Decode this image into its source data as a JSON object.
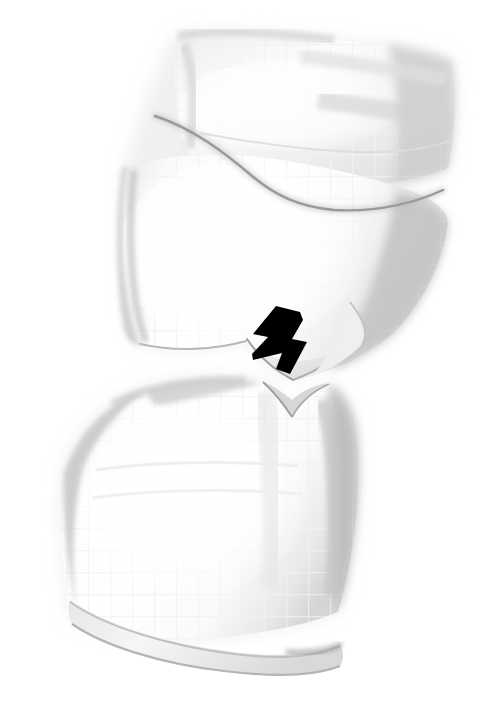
{
  "figure": {
    "title": "Vertebral body compression deformity",
    "modality": "grayscale anatomical line-and-wash illustration",
    "background_color": "#ffffff",
    "canvas": {
      "width": 491,
      "height": 726
    },
    "caption": "",
    "labels": []
  },
  "palette": {
    "background": "#ffffff",
    "bone_fill_light": "#fdfdfd",
    "bone_fill_mid": "#f4f4f4",
    "bone_fill_shadow": "#e3e3e3",
    "bone_edge_soft": "#cfcfcf",
    "bone_edge_dark": "#9a9a9a",
    "contour_line": "#7d7d7d",
    "deep_shadow": "#8e8e8e",
    "marker_black": "#000000",
    "texture_grid": "#f2f2f2"
  },
  "structures": [
    {
      "id": "upper-vertebral-body",
      "name": "Upper vertebral body",
      "bbox": {
        "x": 115,
        "y": 30,
        "width": 340,
        "height": 355
      },
      "description": "Superior vertebra shown in oblique view with a dark curved contour line separating the superior endplate region from the body, and a wedge-shaped inferior-anterior defect.",
      "fill": "#fbfbfb",
      "shadow_side": "right"
    },
    {
      "id": "upper-endplate-ridge",
      "name": "Superior endplate ridge of upper vertebra",
      "description": "Curved dark contour sweeping from upper left down to the right margin.",
      "stroke": "#7d7d7d"
    },
    {
      "id": "inferior-notch-defect",
      "name": "Inferior wedge notch of upper vertebra",
      "bbox": {
        "x": 240,
        "y": 300,
        "width": 120,
        "height": 100
      },
      "description": "V-shaped notch / step-off at the inferior margin of the upper vertebral body, the site indicated by the arrow."
    },
    {
      "id": "lower-vertebral-body",
      "name": "Lower vertebral body",
      "bbox": {
        "x": 50,
        "y": 372,
        "width": 312,
        "height": 300
      },
      "description": "Inferior vertebra with a concave superior surface meeting the notch, rounded left margin, and a thin inferior endplate rim band along the bottom.",
      "fill": "#fcfcfc",
      "shadow_side": "right"
    },
    {
      "id": "inferior-endplate-rim",
      "name": "Inferior endplate rim band",
      "description": "Thin pale band running along the inferior border of the lower vertebral body from lower left to lower right."
    }
  ],
  "annotations": [
    {
      "id": "pointer-arrow",
      "type": "arrow",
      "name": "Solid black arrow marker",
      "color": "#000000",
      "points_to": "inferior-notch-defect",
      "direction": "down-right",
      "tail": {
        "x": 258,
        "y": 310
      },
      "tip": {
        "x": 304,
        "y": 373
      },
      "bbox": {
        "x": 252,
        "y": 306,
        "width": 57,
        "height": 70
      }
    }
  ],
  "texture": {
    "name": "halftone-grid",
    "visible": true,
    "cell_px": 22,
    "color": "#f3f3f3",
    "description": "Very faint square screen/halftone grid visible over the bone fill areas."
  }
}
